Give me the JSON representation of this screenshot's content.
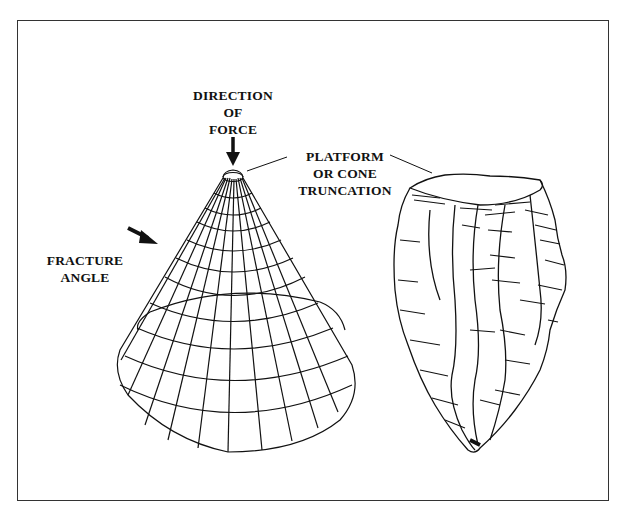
{
  "figure": {
    "type": "line-drawing",
    "colors": {
      "ink": "#111111",
      "background": "#ffffff",
      "frame": "#333333"
    }
  },
  "labels": {
    "direction_of_force": [
      "DIRECTION",
      "OF",
      "FORCE"
    ],
    "platform": [
      "PLATFORM",
      "OR CONE",
      "TRUNCATION"
    ],
    "fracture_angle": [
      "FRACTURE",
      "ANGLE"
    ]
  },
  "elements": {
    "cone": "wireframe cone with truncated apex",
    "core": "hatched stone core with flake scars"
  }
}
